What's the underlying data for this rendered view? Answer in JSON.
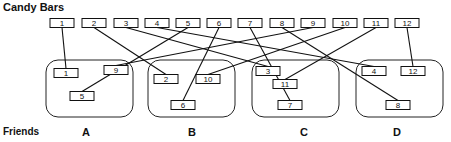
{
  "title": "Candy Bars",
  "friends_label": "Friends",
  "candy_bars": [
    {
      "id": "1",
      "x": 62,
      "y": 23
    },
    {
      "id": "2",
      "x": 94,
      "y": 23
    },
    {
      "id": "3",
      "x": 126,
      "y": 23
    },
    {
      "id": "4",
      "x": 157,
      "y": 23
    },
    {
      "id": "5",
      "x": 188,
      "y": 23
    },
    {
      "id": "6",
      "x": 219,
      "y": 23
    },
    {
      "id": "7",
      "x": 250,
      "y": 23
    },
    {
      "id": "8",
      "x": 282,
      "y": 23
    },
    {
      "id": "9",
      "x": 313,
      "y": 23
    },
    {
      "id": "10",
      "x": 345,
      "y": 23
    },
    {
      "id": "11",
      "x": 376,
      "y": 23
    },
    {
      "id": "12",
      "x": 407,
      "y": 23
    }
  ],
  "groups": [
    {
      "label": "A",
      "x": 46,
      "y": 60,
      "w": 87,
      "h": 57,
      "label_x": 82,
      "members": [
        {
          "id": "1",
          "x": 66,
          "y": 73
        },
        {
          "id": "9",
          "x": 116,
          "y": 70
        },
        {
          "id": "5",
          "x": 82,
          "y": 96
        }
      ]
    },
    {
      "label": "B",
      "x": 148,
      "y": 60,
      "w": 87,
      "h": 57,
      "label_x": 188,
      "members": [
        {
          "id": "2",
          "x": 166,
          "y": 79
        },
        {
          "id": "10",
          "x": 208,
          "y": 79
        },
        {
          "id": "6",
          "x": 183,
          "y": 105
        }
      ]
    },
    {
      "label": "C",
      "x": 252,
      "y": 60,
      "w": 87,
      "h": 57,
      "label_x": 300,
      "members": [
        {
          "id": "3",
          "x": 268,
          "y": 71
        },
        {
          "id": "11",
          "x": 285,
          "y": 84
        },
        {
          "id": "7",
          "x": 290,
          "y": 105
        }
      ]
    },
    {
      "label": "D",
      "x": 356,
      "y": 60,
      "w": 87,
      "h": 57,
      "label_x": 393,
      "members": [
        {
          "id": "4",
          "x": 374,
          "y": 71
        },
        {
          "id": "12",
          "x": 413,
          "y": 71
        },
        {
          "id": "8",
          "x": 398,
          "y": 105
        }
      ]
    }
  ],
  "connections": [
    {
      "from": "1",
      "to": "A:1"
    },
    {
      "from": "2",
      "to": "B:2"
    },
    {
      "from": "3",
      "to": "C:3"
    },
    {
      "from": "4",
      "to": "D:4"
    },
    {
      "from": "5",
      "to": "A:5"
    },
    {
      "from": "6",
      "to": "B:6"
    },
    {
      "from": "7",
      "to": "C:7"
    },
    {
      "from": "8",
      "to": "D:8"
    },
    {
      "from": "9",
      "to": "A:9"
    },
    {
      "from": "10",
      "to": "B:10"
    },
    {
      "from": "11",
      "to": "C:11"
    },
    {
      "from": "12",
      "to": "D:12"
    }
  ]
}
